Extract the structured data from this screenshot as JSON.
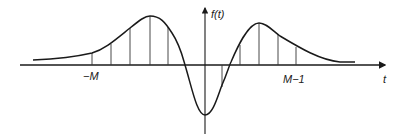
{
  "diagram": {
    "type": "function-plot",
    "labels": {
      "y_axis": "f(t)",
      "x_axis": "t",
      "left_marker": "−M",
      "right_marker": "M−1"
    },
    "colors": {
      "curve": "#1a1a1a",
      "axis": "#1a1a1a",
      "samples": "#333333",
      "background": "#ffffff"
    },
    "samples_x_px": [
      92,
      111,
      130,
      150,
      168,
      222,
      240,
      259,
      278,
      296
    ]
  }
}
